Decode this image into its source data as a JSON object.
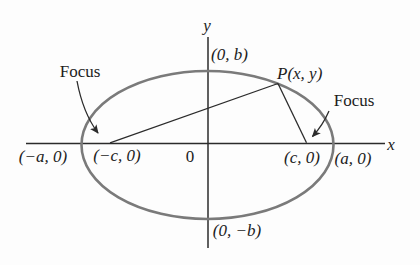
{
  "figure": {
    "type": "ellipse-foci-diagram",
    "labels": {
      "y_axis": "y",
      "x_axis": "x",
      "origin": "0",
      "top_vertex": "(0, b)",
      "bottom_vertex": "(0, −b)",
      "left_vertex": "(−a, 0)",
      "right_vertex": "(a, 0)",
      "left_focus_point": "(−c, 0)",
      "right_focus_point": "(c, 0)",
      "point_p": "P(x, y)",
      "left_focus_callout": "Focus",
      "right_focus_callout": "Focus"
    },
    "colors": {
      "ellipse_stroke": "#7a7a7a",
      "line_color": "#2b2b2b",
      "text_color": "#1c1c1c",
      "background": "#fdfdfd"
    }
  }
}
